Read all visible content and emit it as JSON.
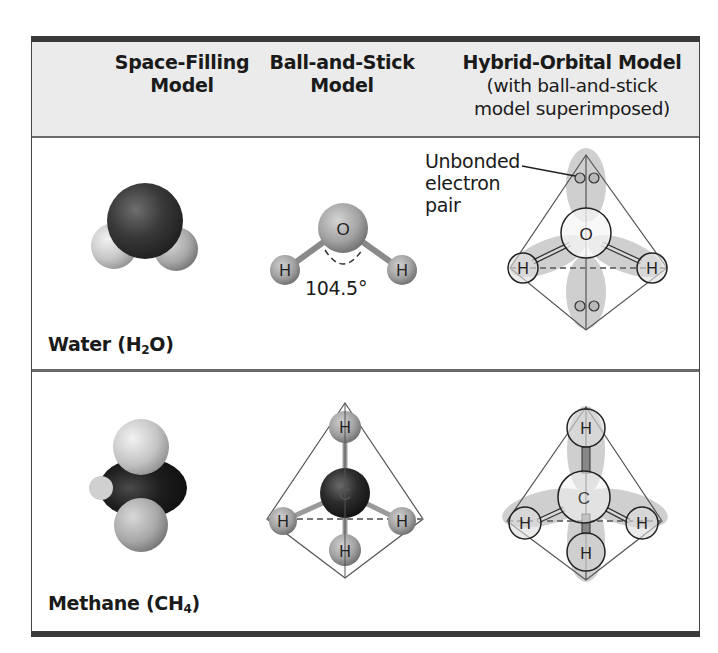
{
  "header": {
    "columns": [
      {
        "title": "Space-Filling",
        "subtitle": "Model"
      },
      {
        "title": "Ball-and-Stick",
        "subtitle": "Model"
      },
      {
        "title": "Hybrid-Orbital Model",
        "subtitle_line1": "(with ball-and-stick",
        "subtitle_line2": "model superimposed)"
      }
    ]
  },
  "rows": [
    {
      "name": "Water",
      "formula_prefix": "(H",
      "formula_sub": "2",
      "formula_suffix": "O)",
      "bond_angle": "104.5°",
      "central_atom": "O",
      "outer_atom": "H",
      "annotation": {
        "line1": "Unbonded",
        "line2": "electron",
        "line3": "pair"
      }
    },
    {
      "name": "Methane",
      "formula_prefix": "(CH",
      "formula_sub": "4",
      "formula_suffix": ")",
      "central_atom": "C",
      "outer_atom": "H"
    }
  ],
  "colors": {
    "header_bg": "#ebebeb",
    "rule_dark": "#3a3a3a",
    "orbital_lobe": "#c8c8c8",
    "oxygen_dark": "#3b3b3b",
    "hydrogen_light": "#bdbdbd",
    "carbon_dark": "#232323"
  }
}
